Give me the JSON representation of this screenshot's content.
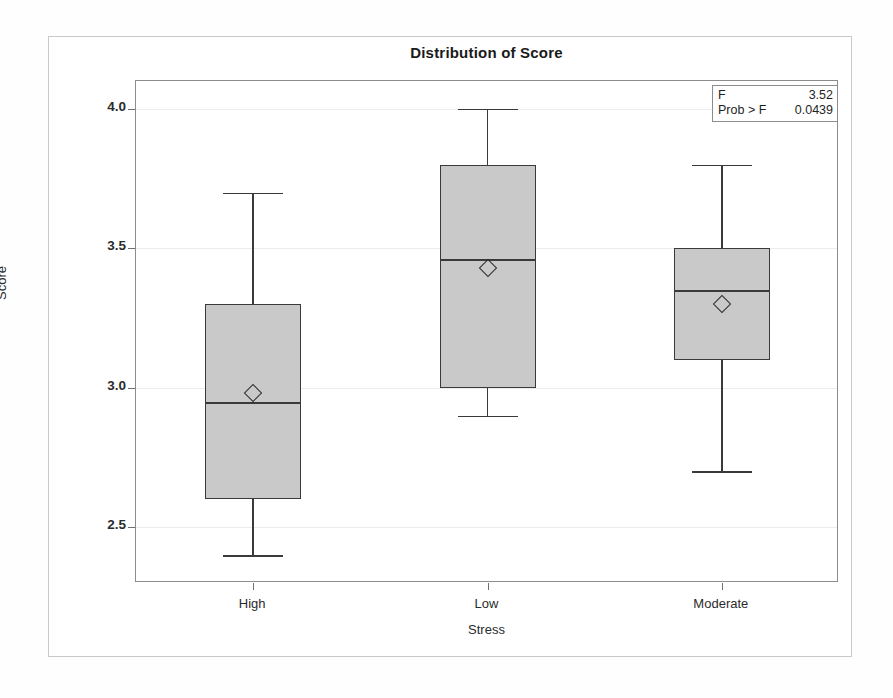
{
  "chart_data": {
    "type": "box",
    "title": "Distribution of Score",
    "xlabel": "Stress",
    "ylabel": "Score",
    "categories": [
      "High",
      "Low",
      "Moderate"
    ],
    "ylim": [
      2.3,
      4.1
    ],
    "yticks": [
      2.5,
      3.0,
      3.5,
      4.0
    ],
    "ytick_labels": [
      "2.5",
      "3.0",
      "3.5",
      "4.0"
    ],
    "grid": true,
    "legend": "none",
    "boxes": [
      {
        "category": "High",
        "whisker_low": 2.4,
        "q1": 2.6,
        "median": 2.95,
        "mean": 2.98,
        "q3": 3.3,
        "whisker_high": 3.7
      },
      {
        "category": "Low",
        "whisker_low": 2.9,
        "q1": 3.0,
        "median": 3.46,
        "mean": 3.43,
        "q3": 3.8,
        "whisker_high": 4.0
      },
      {
        "category": "Moderate",
        "whisker_low": 2.7,
        "q1": 3.1,
        "median": 3.35,
        "mean": 3.3,
        "q3": 3.5,
        "whisker_high": 3.8
      }
    ],
    "annotations": {
      "f_label": "F",
      "f_value": "3.52",
      "prob_label": "Prob > F",
      "prob_value": "0.0439"
    },
    "colors": {
      "box_fill": "#c9c9c9",
      "box_border": "#3a3a3a",
      "gridline": "#ececec",
      "axis": "#8c8c8c",
      "text": "#2b2b2b"
    }
  }
}
